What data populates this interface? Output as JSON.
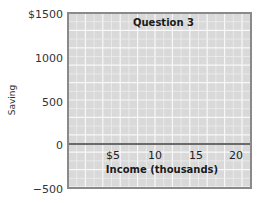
{
  "chart_data": {
    "type": "line",
    "title": "Question 3",
    "xlabel": "Income (thousands)",
    "ylabel": "Saving",
    "x_ticks": [
      5,
      10,
      15,
      20
    ],
    "x_tick_labels": [
      "$5",
      "10",
      "15",
      "20"
    ],
    "y_ticks": [
      1500,
      1000,
      500,
      0,
      -500
    ],
    "y_tick_labels": [
      "$1500",
      "1000",
      "500",
      "0",
      "−500"
    ],
    "xlim": [
      0,
      22
    ],
    "ylim": [
      -500,
      1500
    ],
    "grid": true,
    "series": [],
    "legend": null,
    "colors": {
      "plot_background": "#d9d9d9",
      "grid_minor": "#eeeeee",
      "grid_major": "#f8f8f8",
      "frame": "#8a8a8a",
      "zero_line": "#6a6a6a"
    }
  }
}
